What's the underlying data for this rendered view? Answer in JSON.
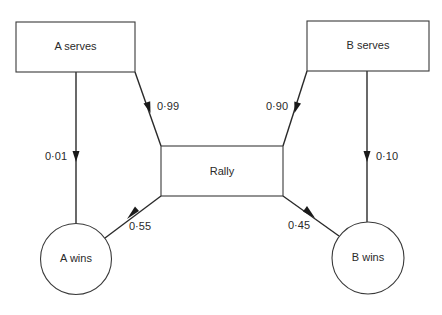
{
  "nodes": {
    "a_serves": {
      "label": "A serves",
      "shape": "rectangle"
    },
    "b_serves": {
      "label": "B serves",
      "shape": "rectangle"
    },
    "rally": {
      "label": "Rally",
      "shape": "rectangle"
    },
    "a_wins": {
      "label": "A wins",
      "shape": "circle"
    },
    "b_wins": {
      "label": "B wins",
      "shape": "circle"
    }
  },
  "edges": {
    "a_serves_to_a_wins": {
      "from": "A serves",
      "to": "A wins",
      "probability": "0·01"
    },
    "a_serves_to_rally": {
      "from": "A serves",
      "to": "Rally",
      "probability": "0·99"
    },
    "b_serves_to_rally": {
      "from": "B serves",
      "to": "Rally",
      "probability": "0·90"
    },
    "b_serves_to_b_wins": {
      "from": "B serves",
      "to": "B wins",
      "probability": "0·10"
    },
    "rally_to_a_wins": {
      "from": "Rally",
      "to": "A wins",
      "probability": "0·55"
    },
    "rally_to_b_wins": {
      "from": "Rally",
      "to": "B wins",
      "probability": "0·45"
    }
  },
  "colors": {
    "line": "#2a2a2a",
    "background": "#ffffff"
  }
}
